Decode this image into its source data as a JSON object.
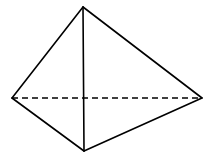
{
  "diagram": {
    "type": "geometric-solid",
    "shape": "triangular-pyramid",
    "stroke_color": "#000000",
    "background": "#ffffff",
    "vertices": {
      "top": [
        83,
        7
      ],
      "left": [
        12,
        98
      ],
      "right": [
        202,
        98
      ],
      "bottom": [
        84,
        151
      ]
    },
    "edges": [
      {
        "from": "top",
        "to": "left",
        "style": "solid"
      },
      {
        "from": "top",
        "to": "right",
        "style": "solid"
      },
      {
        "from": "top",
        "to": "bottom",
        "style": "solid"
      },
      {
        "from": "left",
        "to": "bottom",
        "style": "solid"
      },
      {
        "from": "right",
        "to": "bottom",
        "style": "solid"
      },
      {
        "from": "left",
        "to": "right",
        "style": "dashed"
      }
    ]
  }
}
